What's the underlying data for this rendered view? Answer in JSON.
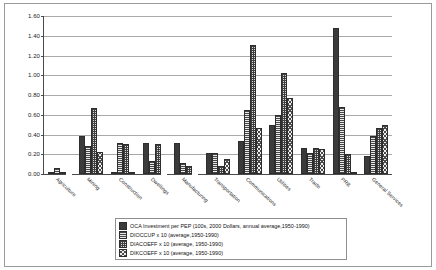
{
  "chart_data": {
    "type": "bar",
    "title": "",
    "xlabel": "",
    "ylabel": "",
    "ylim": [
      0.0,
      1.6
    ],
    "ytick_step": 0.2,
    "yticks": [
      "0.00",
      "0.20",
      "0.40",
      "0.60",
      "0.80",
      "1.00",
      "1.20",
      "1.40",
      "1.60"
    ],
    "grid": true,
    "legend_position": "bottom",
    "categories": [
      "Agriculture",
      "Mining",
      "Construction",
      "Dwellings",
      "Manufacturing",
      "Transportation",
      "Communications",
      "Utilities",
      "Trade",
      "PRB",
      "General Services"
    ],
    "series": [
      {
        "name": "OCA Investment per PEP (100s, 2000 Dollars, annual average,1950-1990)",
        "pattern": "solid-dark",
        "values": [
          0.02,
          0.38,
          0.02,
          0.31,
          0.31,
          0.21,
          0.33,
          0.5,
          0.26,
          1.48,
          0.18
        ]
      },
      {
        "name": "DIOCCUP x 10 (average,1950-1990)",
        "pattern": "horizontal-lines",
        "values": [
          0.06,
          0.28,
          0.31,
          0.13,
          0.11,
          0.21,
          0.65,
          0.6,
          0.21,
          0.68,
          0.38
        ]
      },
      {
        "name": "DIACOEFF x 10 (average, 1950-1990)",
        "pattern": "grid-crosshatch",
        "values": [
          0.02,
          0.67,
          0.3,
          0.3,
          0.08,
          0.08,
          1.31,
          1.02,
          0.26,
          0.2,
          0.47
        ]
      },
      {
        "name": "DIKCOEFF x 10 (average, 1950-1990)",
        "pattern": "diagonal-crosshatch",
        "values": [
          0.0,
          0.22,
          0.01,
          0.0,
          0.0,
          0.15,
          0.47,
          0.77,
          0.25,
          0.02,
          0.5
        ]
      }
    ]
  },
  "legend": {
    "items": [
      "OCA Investment per PEP (100s, 2000 Dollars, annual average,1950-1990)",
      "DIOCCUP x 10 (average,1950-1990)",
      "DIACOEFF x 10 (average, 1950-1990)",
      "DIKCOEFF x 10 (average, 1950-1990)"
    ]
  }
}
